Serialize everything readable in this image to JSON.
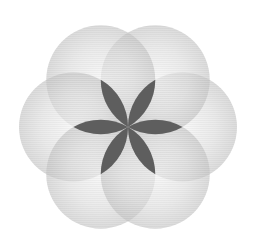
{
  "diagram": {
    "title": "",
    "type": "six overlapping circles (seed of life)",
    "center": [
      128,
      127
    ],
    "circle_radius": 54.5,
    "circle_count": 6,
    "circle_angles_deg": [
      0,
      60,
      120,
      180,
      240,
      300
    ],
    "petal_count": 6,
    "colors": {
      "background": "#ffffff",
      "circle_fill": "#c8c8c8",
      "circle_fill_light": "#efefef",
      "petal_fill": "#5e5e5e"
    }
  }
}
